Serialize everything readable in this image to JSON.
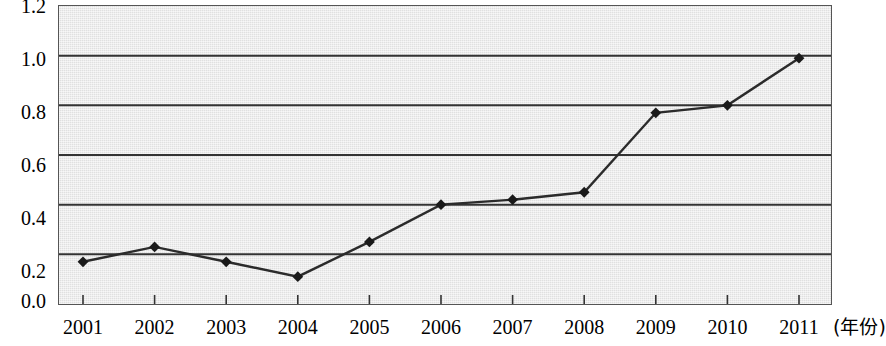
{
  "chart_data": {
    "type": "line",
    "title": "",
    "subtitle": "",
    "xlabel": "(年份)",
    "ylabel": "",
    "categories": [
      "2001",
      "2002",
      "2003",
      "2004",
      "2005",
      "2006",
      "2007",
      "2008",
      "2009",
      "2010",
      "2011"
    ],
    "values": [
      0.17,
      0.23,
      0.17,
      0.11,
      0.25,
      0.4,
      0.42,
      0.45,
      0.77,
      0.8,
      0.99
    ],
    "series": [
      {
        "name": "series-1",
        "values": [
          0.17,
          0.23,
          0.17,
          0.11,
          0.25,
          0.4,
          0.42,
          0.45,
          0.77,
          0.8,
          0.99
        ]
      }
    ],
    "ylim": [
      0.0,
      1.2
    ],
    "yticks": [
      "0.0",
      "0.2",
      "0.4",
      "0.6",
      "0.8",
      "1.0",
      "1.2"
    ],
    "ytick_values": [
      0.0,
      0.2,
      0.4,
      0.6,
      0.8,
      1.0,
      1.2
    ],
    "xticks": [
      "2001",
      "2002",
      "2003",
      "2004",
      "2005",
      "2006",
      "2007",
      "2008",
      "2009",
      "2010",
      "2011"
    ],
    "grid": "horizontal",
    "legend": "none",
    "marker": "diamond",
    "colors": {
      "line": "#2b2b2b",
      "marker": "#1a1a1a",
      "grid": "#333333",
      "plot_background": "#e9e9e9",
      "axis": "#555555",
      "text": "#000000"
    }
  },
  "axis": {
    "x_name_label": "(年份)"
  }
}
